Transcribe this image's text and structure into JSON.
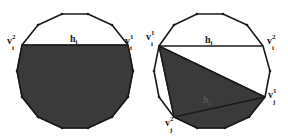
{
  "figure": {
    "colors": {
      "stroke": "#1a1a1a",
      "fill": "#3a3a3a",
      "background": "#ffffff"
    },
    "left": {
      "chord_label": "h",
      "chord_sub": "i",
      "vertices": [
        {
          "name": "v",
          "sub": "i",
          "sup": "2"
        },
        {
          "name": "v",
          "sub": "i",
          "sup": "1"
        }
      ]
    },
    "right": {
      "chord_i_label": "h",
      "chord_i_sub": "i",
      "chord_j_label": "h",
      "chord_j_sub": "j",
      "vertices": [
        {
          "name": "v",
          "sub": "i",
          "sup": "1"
        },
        {
          "name": "v",
          "sub": "i",
          "sup": "2"
        },
        {
          "name": "v",
          "sub": "j",
          "sup": "1"
        },
        {
          "name": "v",
          "sub": "j",
          "sup": "2"
        }
      ]
    }
  }
}
